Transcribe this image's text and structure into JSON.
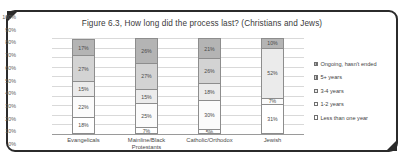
{
  "chart_data": {
    "type": "bar",
    "subtype": "100% stacked column",
    "title": "Figure 6.3, How long did the process last? (Christians and Jews)",
    "xlabel": "",
    "ylabel": "",
    "ylim": [
      0,
      100
    ],
    "grid": true,
    "legend_position": "right",
    "categories": [
      "Evangelicals",
      "Mainline/Black Protestants",
      "Catholic/Orthodox",
      "Jewish"
    ],
    "category_lines": [
      [
        "Evangelicals"
      ],
      [
        "Mainline/Black",
        "Protestants"
      ],
      [
        "Catholic/Orthodox"
      ],
      [
        "Jewish"
      ]
    ],
    "ytick_labels": [
      "100%",
      "90%",
      "80%",
      "70%",
      "60%",
      "50%",
      "40%",
      "30%",
      "20%",
      "10%",
      "0%"
    ],
    "ytick_values": [
      100,
      90,
      80,
      70,
      60,
      50,
      40,
      30,
      20,
      10,
      0
    ],
    "series": [
      {
        "name": "Less than one year",
        "marker": "empty",
        "color": "#ffffff",
        "values": [
          18,
          7,
          5,
          31
        ],
        "labels": [
          "18%",
          "7%",
          "5%",
          "31%"
        ]
      },
      {
        "name": "1-2 years",
        "marker": "empty",
        "color": "#fbfbfb",
        "values": [
          22,
          25,
          30,
          7
        ],
        "labels": [
          "22%",
          "25%",
          "30%",
          "7%"
        ]
      },
      {
        "name": "3-4 years",
        "marker": "empty",
        "color": "#ebebeb",
        "values": [
          15,
          15,
          18,
          52
        ],
        "labels": [
          "15%",
          "15%",
          "18%",
          "52%"
        ]
      },
      {
        "name": "5+ years",
        "marker": "hatch",
        "color": "#d3d3d3",
        "values": [
          27,
          27,
          26,
          0
        ],
        "labels": [
          "27%",
          "27%",
          "26%",
          ""
        ]
      },
      {
        "name": "Ongoing,  hasn't ended",
        "marker": "hatch",
        "color": "#b4b4b4",
        "values": [
          17,
          26,
          21,
          10
        ],
        "labels": [
          "17%",
          "26%",
          "21%",
          "10%"
        ]
      }
    ],
    "legend_order_displayed": [
      "Ongoing,  hasn't ended",
      "5+ years",
      "3-4 years",
      "1-2 years",
      "Less than one year"
    ]
  }
}
